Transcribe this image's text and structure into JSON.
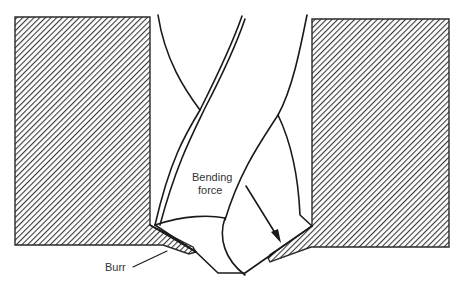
{
  "diagram": {
    "labels": {
      "bending_force": [
        "Bending",
        "force"
      ],
      "burr": "Burr"
    },
    "colors": {
      "line": "#1a1a1a",
      "hatch": "#3a3a3a",
      "background": "#ffffff",
      "label": "#333333"
    },
    "elements": [
      {
        "name": "left-workpiece-block",
        "type": "hatched-block"
      },
      {
        "name": "right-workpiece-block",
        "type": "hatched-block"
      },
      {
        "name": "drill-bit",
        "type": "outline"
      },
      {
        "name": "bending-force-arrow",
        "type": "arrow"
      },
      {
        "name": "burr-left",
        "type": "hatched-lip"
      },
      {
        "name": "burr-right",
        "type": "hatched-lip"
      }
    ]
  }
}
